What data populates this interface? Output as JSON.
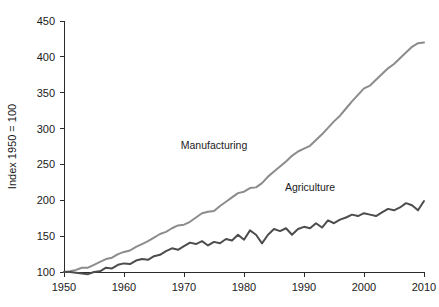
{
  "chart_data": {
    "type": "line",
    "title": "",
    "xlabel": "",
    "ylabel": "Index 1950 = 100",
    "xlim": [
      1950,
      2010
    ],
    "ylim": [
      100,
      450
    ],
    "grid": false,
    "legend_position": "inline-annotation",
    "xticks": [
      "1950",
      "1960",
      "1970",
      "1980",
      "1990",
      "2000",
      "2010"
    ],
    "yticks": [
      "100",
      "150",
      "200",
      "250",
      "300",
      "350",
      "400",
      "450"
    ],
    "x": [
      1950,
      1951,
      1952,
      1953,
      1954,
      1955,
      1956,
      1957,
      1958,
      1959,
      1960,
      1961,
      1962,
      1963,
      1964,
      1965,
      1966,
      1967,
      1968,
      1969,
      1970,
      1971,
      1972,
      1973,
      1974,
      1975,
      1976,
      1977,
      1978,
      1979,
      1980,
      1981,
      1982,
      1983,
      1984,
      1985,
      1986,
      1987,
      1988,
      1989,
      1990,
      1991,
      1992,
      1993,
      1994,
      1995,
      1996,
      1997,
      1998,
      1999,
      2000,
      2001,
      2002,
      2003,
      2004,
      2005,
      2006,
      2007,
      2008,
      2009,
      2010
    ],
    "series": [
      {
        "name": "Manufacturing",
        "color": "#8c8c8c",
        "label_x": 1975,
        "label_y": 272,
        "values": [
          100,
          101,
          103,
          106,
          106,
          110,
          114,
          118,
          120,
          125,
          128,
          130,
          135,
          139,
          143,
          148,
          153,
          156,
          161,
          165,
          166,
          170,
          176,
          182,
          184,
          185,
          192,
          198,
          204,
          210,
          212,
          217,
          218,
          224,
          233,
          240,
          247,
          254,
          262,
          268,
          272,
          276,
          284,
          292,
          301,
          310,
          318,
          328,
          338,
          347,
          356,
          360,
          368,
          376,
          384,
          390,
          398,
          406,
          414,
          419,
          420
        ]
      },
      {
        "name": "Agriculture",
        "color": "#4d4d4d",
        "label_x": 1991,
        "label_y": 213,
        "values": [
          100,
          100,
          99,
          98,
          97,
          100,
          101,
          106,
          105,
          110,
          112,
          111,
          116,
          118,
          117,
          122,
          124,
          129,
          133,
          131,
          136,
          141,
          139,
          143,
          137,
          142,
          140,
          146,
          144,
          152,
          145,
          158,
          152,
          140,
          152,
          160,
          157,
          161,
          152,
          160,
          163,
          161,
          168,
          162,
          172,
          168,
          173,
          176,
          180,
          178,
          182,
          180,
          178,
          183,
          188,
          186,
          190,
          196,
          193,
          186,
          199
        ]
      }
    ]
  },
  "axis": {
    "y_title": "Index 1950 = 100"
  }
}
